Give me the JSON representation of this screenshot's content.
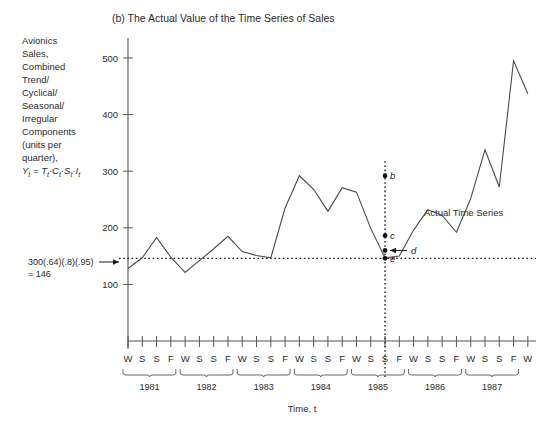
{
  "chart_data": {
    "type": "line",
    "title": "(b) The Actual Value of the Time Series of Sales",
    "ylabel": "Avionics Sales, Combined Trend/ Cyclical/ Seasonal/ Irregular Components (units per quarter), Yt = Tt·Ct·St·It",
    "xlabel": "Time, t",
    "ylim": [
      0,
      530
    ],
    "yticks": [
      100,
      200,
      300,
      400,
      500
    ],
    "ytick_labels": [
      "100",
      "200",
      "300",
      "400",
      "500"
    ],
    "grid": false,
    "legend": "none",
    "series_label": "Actual Time Series",
    "quarter_labels": [
      "W",
      "S",
      "S",
      "F"
    ],
    "years": [
      "1981",
      "1982",
      "1983",
      "1984",
      "1985",
      "1986",
      "1987"
    ],
    "x_tick_labels": [
      "W",
      "S",
      "S",
      "F",
      "W",
      "S",
      "S",
      "F",
      "W",
      "S",
      "S",
      "F",
      "W",
      "S",
      "S",
      "F",
      "W",
      "S",
      "S",
      "F",
      "W",
      "S",
      "S",
      "F",
      "W",
      "S",
      "S",
      "F",
      "W"
    ],
    "x": [
      1,
      2,
      3,
      4,
      5,
      6,
      7,
      8,
      9,
      10,
      11,
      12,
      13,
      14,
      15,
      16,
      17,
      18,
      19,
      20,
      21,
      22,
      23,
      24,
      25,
      26,
      27,
      28,
      29
    ],
    "values": [
      128,
      147,
      183,
      148,
      121,
      142,
      163,
      185,
      158,
      151,
      147,
      235,
      292,
      268,
      229,
      271,
      263,
      199,
      147,
      150,
      196,
      232,
      222,
      192,
      252,
      338,
      272,
      495,
      437
    ],
    "reference_line": {
      "value": 146,
      "label": "300(.64)(.8)(.95) = 146",
      "label_line1": "300(.64)(.8)(.95)",
      "label_line2": "= 146",
      "style": "dotted"
    },
    "vertical_line": {
      "at_x": 19,
      "style": "dotted"
    },
    "annotations": [
      {
        "key": "b",
        "label": "b",
        "x": 19,
        "y": 292
      },
      {
        "key": "c",
        "label": "c",
        "x": 19,
        "y": 186
      },
      {
        "key": "d",
        "label": "d",
        "x": 19,
        "y": 160,
        "has_arrow": true
      },
      {
        "key": "e",
        "label": "e",
        "x": 19,
        "y": 146
      }
    ]
  },
  "colors": {
    "line": "#4a4a4a",
    "axis": "#555555",
    "text": "#2b2b2b",
    "marker": "#111111",
    "background": "#ffffff"
  },
  "ylabel_lines": [
    "Avionics",
    "Sales,",
    "Combined",
    "Trend/",
    "Cyclical/",
    "Seasonal/",
    "Irregular",
    "Components",
    "(units per",
    "quarter),"
  ],
  "ylabel_formula": {
    "y": "Y",
    "sub_t": "t",
    "eq": " = ",
    "tt": "T",
    "ct": "C",
    "st": "S",
    "it": "I",
    "dot": "·"
  }
}
